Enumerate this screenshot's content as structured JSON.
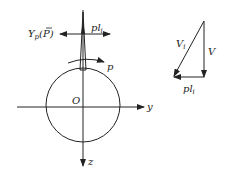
{
  "diagram": {
    "left_figure": {
      "force_left_label": "Y",
      "force_left_sub": "p",
      "force_left_paren": "(P)",
      "force_right_label": "pl",
      "force_right_sub": "i",
      "rotation_label": "p",
      "origin_label": "O",
      "y_axis_label": "y",
      "z_axis_label": "z"
    },
    "right_figure": {
      "hypotenuse_label": "V",
      "hypotenuse_sub": "i",
      "vertical_label": "V",
      "horizontal_label": "pl",
      "horizontal_sub": "i"
    },
    "colors": {
      "stroke": "#222222",
      "background": "#ffffff"
    }
  }
}
